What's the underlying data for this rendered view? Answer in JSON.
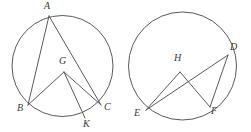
{
  "figure": {
    "stroke_color": "#5a5a5a",
    "label_color": "#3a3a3a",
    "background_color": "#ffffff",
    "canvas": {
      "width": 251,
      "height": 132
    }
  },
  "circles": [
    {
      "name": "left-circle",
      "center": {
        "x": 62.5,
        "y": 66
      },
      "radius": 50.5,
      "labels": [
        "A",
        "B",
        "C",
        "G",
        "K"
      ]
    },
    {
      "name": "right-circle",
      "center": {
        "x": 182.5,
        "y": 66
      },
      "radius": 54,
      "labels": [
        "D",
        "E",
        "F",
        "H"
      ]
    }
  ],
  "points": {
    "A": {
      "label": "A",
      "x": 49,
      "y": 16,
      "label_x": 44,
      "label_y": 1
    },
    "B": {
      "label": "B",
      "x": 28,
      "y": 105,
      "label_x": 17,
      "label_y": 103
    },
    "C": {
      "label": "C",
      "x": 101,
      "y": 105,
      "label_x": 104,
      "label_y": 102
    },
    "G": {
      "label": "G",
      "x": 64,
      "y": 72,
      "label_x": 59,
      "label_y": 56
    },
    "K": {
      "label": "K",
      "x": 85,
      "y": 118,
      "label_x": 83,
      "label_y": 119
    },
    "D": {
      "label": "D",
      "x": 228,
      "y": 55,
      "label_x": 230,
      "label_y": 42
    },
    "E": {
      "label": "E",
      "x": 146,
      "y": 110,
      "label_x": 134,
      "label_y": 108
    },
    "F": {
      "label": "F",
      "x": 210,
      "y": 107,
      "label_x": 211,
      "label_y": 106
    },
    "H": {
      "label": "H",
      "x": 180,
      "y": 72,
      "label_x": 174,
      "label_y": 53
    }
  },
  "segments": [
    {
      "name": "segment-AB",
      "from": "A",
      "to": "B"
    },
    {
      "name": "segment-AC",
      "from": "A",
      "to": "C"
    },
    {
      "name": "segment-GB",
      "from": "G",
      "to": "B"
    },
    {
      "name": "segment-GC",
      "from": "G",
      "to": "C"
    },
    {
      "name": "segment-GK",
      "from": "G",
      "to": "K"
    },
    {
      "name": "segment-ED",
      "from": "E",
      "to": "D"
    },
    {
      "name": "segment-EH",
      "from": "E",
      "to": "H"
    },
    {
      "name": "segment-HF",
      "from": "H",
      "to": "F"
    },
    {
      "name": "segment-DF",
      "from": "D",
      "to": "F"
    }
  ]
}
